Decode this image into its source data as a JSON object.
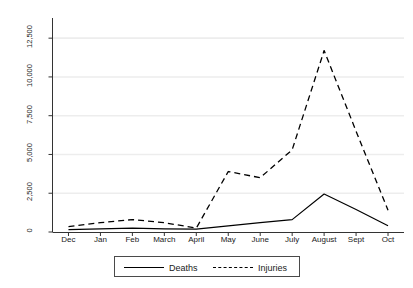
{
  "chart_data": {
    "type": "line",
    "title": "",
    "xlabel": "",
    "ylabel": "Reported casualties per month",
    "categories": [
      "Dec",
      "Jan",
      "Feb",
      "March",
      "April",
      "May",
      "June",
      "July",
      "August",
      "Sept",
      "Oct"
    ],
    "ylim": [
      0,
      13800
    ],
    "yticks": [
      0,
      2500,
      5000,
      7500,
      10000,
      12500
    ],
    "ytick_labels": [
      "0",
      "2,500",
      "5,000",
      "7,500",
      "10,000",
      "12,500"
    ],
    "grid": true,
    "grid_axis": "y",
    "legend_position": "bottom",
    "series": [
      {
        "name": "Deaths",
        "style": "solid",
        "color": "#000000",
        "values": [
          150,
          200,
          250,
          200,
          180,
          400,
          600,
          800,
          2450,
          1450,
          400
        ]
      },
      {
        "name": "Injuries",
        "style": "dashed",
        "color": "#000000",
        "values": [
          350,
          600,
          800,
          600,
          250,
          3900,
          3500,
          5300,
          11700,
          6500,
          1400
        ]
      }
    ]
  },
  "legend": {
    "entries": [
      {
        "label": "Deaths"
      },
      {
        "label": "Injuries"
      }
    ]
  },
  "axes": {
    "y_title": "Reported casualties per month"
  }
}
